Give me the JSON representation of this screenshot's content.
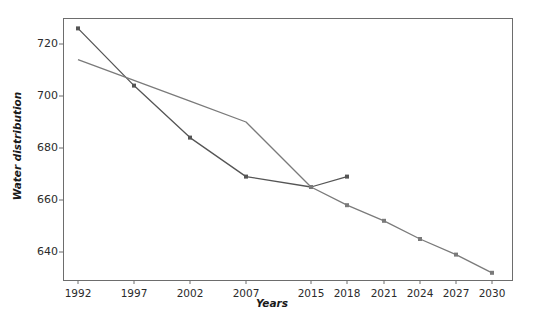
{
  "chart_data": {
    "type": "line",
    "title": "",
    "xlabel": "Years",
    "ylabel": "Water distribution",
    "categories": [
      "1992",
      "1997",
      "2002",
      "2007",
      "2015",
      "2018",
      "2021",
      "2024",
      "2027",
      "2030"
    ],
    "ylim": [
      630,
      730
    ],
    "yticks": [
      640,
      660,
      680,
      700,
      720
    ],
    "ytick_labels": [
      "640",
      "660",
      "680",
      "700",
      "720"
    ],
    "grid": false,
    "legend": "none",
    "series": [
      {
        "name": "Water distribution (observed)",
        "color": "#555555",
        "markers": true,
        "x": [
          "1992",
          "1997",
          "2002",
          "2007",
          "2015",
          "2018"
        ],
        "values": [
          726,
          704,
          684,
          669,
          665,
          669
        ]
      },
      {
        "name": "Water distribution (trend)",
        "color": "#7a7a7a",
        "markers": true,
        "x": [
          "1992",
          "1997",
          "2002",
          "2007",
          "2015",
          "2018",
          "2021",
          "2024",
          "2027",
          "2030"
        ],
        "values": [
          714,
          706,
          698,
          690,
          665,
          658,
          652,
          645,
          639,
          632
        ]
      }
    ]
  },
  "axis": {
    "ytick_labels": [
      "720",
      "700",
      "680",
      "660",
      "640"
    ],
    "xtick_labels": [
      "1992",
      "1997",
      "2002",
      "2007",
      "2015",
      "2018",
      "2021",
      "2024",
      "2027",
      "2030"
    ],
    "ylabel": "Water distribution",
    "xlabel": "Years"
  },
  "colors": {
    "frame": "#6d6d6d",
    "series_observed": "#555555",
    "series_trend": "#7a7a7a",
    "text": "#2b2b2b",
    "background": "#ffffff"
  }
}
